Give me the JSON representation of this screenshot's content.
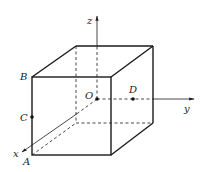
{
  "figure": {
    "type": "cube-with-coordinate-axes",
    "axes": {
      "x_label": "x",
      "y_label": "y",
      "z_label": "z",
      "origin_label": "O"
    },
    "points": {
      "A": "A",
      "B": "B",
      "C": "C",
      "D": "D"
    },
    "colors": {
      "line": "#1a1a1a",
      "background": "#ffffff"
    }
  }
}
